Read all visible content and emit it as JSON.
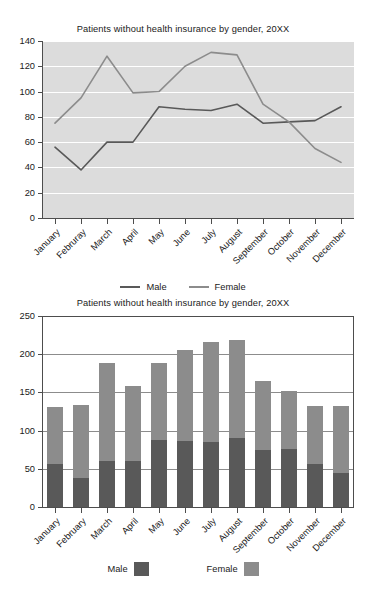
{
  "line_chart": {
    "title": "Patients without health insurance by gender, 20XX",
    "legend": [
      {
        "label": "Male",
        "color": "#595959"
      },
      {
        "label": "Female",
        "color": "#8c8c8c"
      }
    ],
    "plot_bg": "#dcdcdc",
    "grid_color": "#ffffff",
    "axis_color": "#4d4d4d"
  },
  "bar_chart": {
    "title": "Patients without health insurance by gender, 20XX",
    "legend": [
      {
        "label": "Male",
        "color": "#595959"
      },
      {
        "label": "Female",
        "color": "#8c8c8c"
      }
    ],
    "plot_bg": "#ffffff",
    "grid_color": "#8c8c8c",
    "axis_color": "#4d4d4d"
  },
  "chart_data": [
    {
      "type": "line",
      "title": "Patients without health insurance by gender, 20XX",
      "xlabel": "",
      "ylabel": "",
      "ylim": [
        0,
        140
      ],
      "yticks": [
        0,
        20,
        40,
        60,
        80,
        100,
        120,
        140
      ],
      "grid": true,
      "legend_position": "bottom",
      "categories": [
        "January",
        "Februray",
        "March",
        "April",
        "May",
        "June",
        "July",
        "August",
        "September",
        "October",
        "November",
        "December"
      ],
      "series": [
        {
          "name": "Male",
          "color": "#595959",
          "values": [
            56,
            38,
            60,
            60,
            88,
            86,
            85,
            90,
            75,
            76,
            77,
            88
          ]
        },
        {
          "name": "Female",
          "color": "#8c8c8c",
          "values": [
            75,
            95,
            128,
            99,
            100,
            120,
            131,
            129,
            90,
            76,
            55,
            44
          ]
        }
      ]
    },
    {
      "type": "bar",
      "stacked": true,
      "title": "Patients without health insurance by gender, 20XX",
      "xlabel": "",
      "ylabel": "",
      "ylim": [
        0,
        250
      ],
      "yticks": [
        0,
        50,
        100,
        150,
        200,
        250
      ],
      "grid": true,
      "legend_position": "bottom",
      "categories": [
        "January",
        "February",
        "March",
        "April",
        "May",
        "June",
        "July",
        "August",
        "September",
        "October",
        "November",
        "December"
      ],
      "series": [
        {
          "name": "Male",
          "color": "#595959",
          "values": [
            56,
            38,
            60,
            60,
            88,
            86,
            85,
            90,
            75,
            76,
            56,
            45
          ]
        },
        {
          "name": "Female",
          "color": "#8c8c8c",
          "values": [
            75,
            95,
            128,
            99,
            100,
            120,
            131,
            129,
            90,
            76,
            76,
            87
          ]
        }
      ],
      "totals": [
        131,
        133,
        188,
        159,
        188,
        206,
        216,
        219,
        165,
        152,
        132,
        132
      ]
    }
  ]
}
